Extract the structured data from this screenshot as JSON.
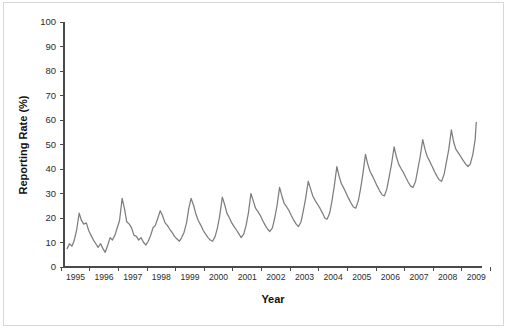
{
  "chart_data": {
    "type": "line",
    "title": "",
    "xlabel": "Year",
    "ylabel": "Reporting Rate (%)",
    "xlim": [
      1994.6,
      2009.2
    ],
    "ylim": [
      0,
      100
    ],
    "grid": false,
    "legend": null,
    "line_color": "#7d7d7d",
    "axis_color": "#4a4a4a",
    "yticks": [
      0,
      10,
      20,
      30,
      40,
      50,
      60,
      70,
      80,
      90,
      100
    ],
    "ytick_labels": [
      "0",
      "10",
      "20",
      "30",
      "40",
      "50",
      "60",
      "70",
      "80",
      "90",
      "100"
    ],
    "xticks": [
      1995,
      1996,
      1997,
      1998,
      1999,
      2000,
      2001,
      2002,
      2003,
      2004,
      2005,
      2006,
      2007,
      2008,
      2009
    ],
    "xtick_labels": [
      "1995",
      "1996",
      "1997",
      "1998",
      "1999",
      "2000",
      "2001",
      "2002",
      "2003",
      "2004",
      "2005",
      "2006",
      "2007",
      "2008",
      "2009"
    ],
    "series": [
      {
        "name": "Reporting Rate",
        "x": [
          1994.71,
          1994.79,
          1994.88,
          1994.96,
          1995.04,
          1995.13,
          1995.21,
          1995.29,
          1995.38,
          1995.46,
          1995.54,
          1995.63,
          1995.71,
          1995.79,
          1995.88,
          1995.96,
          1996.04,
          1996.13,
          1996.21,
          1996.29,
          1996.38,
          1996.46,
          1996.54,
          1996.63,
          1996.71,
          1996.79,
          1996.88,
          1996.96,
          1997.04,
          1997.13,
          1997.21,
          1997.29,
          1997.38,
          1997.46,
          1997.54,
          1997.63,
          1997.71,
          1997.79,
          1997.88,
          1997.96,
          1998.04,
          1998.13,
          1998.21,
          1998.29,
          1998.38,
          1998.46,
          1998.54,
          1998.63,
          1998.71,
          1998.79,
          1998.88,
          1998.96,
          1999.04,
          1999.13,
          1999.21,
          1999.29,
          1999.38,
          1999.46,
          1999.54,
          1999.63,
          1999.71,
          1999.79,
          1999.88,
          1999.96,
          2000.04,
          2000.13,
          2000.21,
          2000.29,
          2000.38,
          2000.46,
          2000.54,
          2000.63,
          2000.71,
          2000.79,
          2000.88,
          2000.96,
          2001.04,
          2001.13,
          2001.21,
          2001.29,
          2001.38,
          2001.46,
          2001.54,
          2001.63,
          2001.71,
          2001.79,
          2001.88,
          2001.96,
          2002.04,
          2002.13,
          2002.21,
          2002.29,
          2002.38,
          2002.46,
          2002.54,
          2002.63,
          2002.71,
          2002.79,
          2002.88,
          2002.96,
          2003.04,
          2003.13,
          2003.21,
          2003.29,
          2003.38,
          2003.46,
          2003.54,
          2003.63,
          2003.71,
          2003.79,
          2003.88,
          2003.96,
          2004.04,
          2004.13,
          2004.21,
          2004.29,
          2004.38,
          2004.46,
          2004.54,
          2004.63,
          2004.71,
          2004.79,
          2004.88,
          2004.96,
          2005.04,
          2005.13,
          2005.21,
          2005.29,
          2005.38,
          2005.46,
          2005.54,
          2005.63,
          2005.71,
          2005.79,
          2005.88,
          2005.96,
          2006.04,
          2006.13,
          2006.21,
          2006.29,
          2006.38,
          2006.46,
          2006.54,
          2006.63,
          2006.71,
          2006.79,
          2006.88,
          2006.96,
          2007.04,
          2007.13,
          2007.21,
          2007.29,
          2007.38,
          2007.46,
          2007.54,
          2007.63,
          2007.71,
          2007.79,
          2007.88,
          2007.96,
          2008.04,
          2008.13,
          2008.21,
          2008.29,
          2008.38,
          2008.46,
          2008.54,
          2008.63,
          2008.71,
          2008.79,
          2008.88,
          2008.96,
          2009.0
        ],
        "values": [
          7.5,
          9.5,
          8.5,
          11.0,
          15.0,
          22.0,
          19.0,
          17.5,
          18.0,
          15.0,
          13.0,
          11.0,
          9.5,
          8.0,
          9.5,
          7.5,
          6.0,
          9.0,
          12.0,
          11.0,
          13.0,
          16.0,
          19.0,
          28.0,
          24.0,
          18.5,
          17.5,
          16.0,
          13.0,
          12.5,
          11.0,
          12.0,
          10.0,
          9.0,
          10.5,
          13.0,
          16.0,
          17.0,
          20.0,
          23.0,
          21.0,
          18.0,
          17.0,
          15.5,
          14.0,
          12.5,
          11.5,
          10.5,
          12.0,
          14.0,
          18.0,
          24.0,
          28.0,
          25.0,
          21.5,
          19.0,
          17.0,
          15.0,
          13.5,
          12.0,
          11.0,
          10.5,
          12.5,
          16.0,
          21.0,
          28.5,
          25.5,
          22.0,
          20.0,
          18.0,
          16.5,
          15.0,
          13.5,
          12.0,
          13.5,
          17.0,
          22.0,
          30.0,
          27.0,
          24.0,
          22.5,
          21.0,
          19.0,
          17.0,
          15.5,
          14.5,
          16.0,
          20.0,
          25.0,
          32.5,
          29.0,
          26.0,
          24.5,
          23.0,
          21.0,
          19.0,
          17.5,
          16.5,
          18.5,
          23.0,
          28.0,
          35.0,
          32.0,
          29.0,
          27.0,
          25.5,
          24.0,
          22.0,
          20.0,
          19.5,
          22.0,
          27.0,
          33.0,
          41.0,
          37.0,
          34.0,
          32.0,
          30.0,
          28.0,
          26.0,
          24.5,
          24.0,
          27.0,
          32.0,
          38.0,
          46.0,
          42.0,
          39.0,
          37.0,
          35.0,
          33.0,
          31.0,
          29.5,
          29.0,
          32.0,
          37.0,
          42.0,
          49.0,
          45.0,
          42.0,
          40.0,
          38.5,
          36.5,
          34.5,
          33.0,
          32.5,
          35.0,
          40.0,
          45.0,
          52.0,
          48.0,
          45.0,
          43.0,
          41.0,
          39.0,
          37.0,
          35.5,
          35.0,
          38.0,
          43.0,
          48.0,
          56.0,
          51.0,
          48.0,
          46.5,
          45.0,
          43.5,
          42.0,
          41.0,
          42.0,
          46.0,
          52.0,
          59.0
        ]
      }
    ]
  }
}
